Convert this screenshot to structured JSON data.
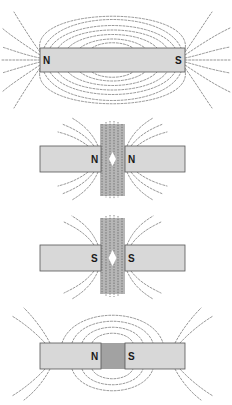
{
  "figure": {
    "colors": {
      "magnet_fill": "#d8d8d8",
      "magnet_stroke": "#555555",
      "filings": "#6a6a6a",
      "background": "#ffffff"
    },
    "panels": [
      {
        "id": "single-bar",
        "caption": "Single bar magnet",
        "left_pole": "N",
        "right_pole": "S"
      },
      {
        "id": "like-poles-north",
        "caption": "Two magnets, like poles facing (N–N)",
        "left_pole": "N",
        "right_pole": "N"
      },
      {
        "id": "like-poles-south",
        "caption": "Two magnets, like poles facing (S–S)",
        "left_pole": "S",
        "right_pole": "S"
      },
      {
        "id": "unlike-poles",
        "caption": "Two magnets, unlike poles facing (N–S)",
        "left_pole": "N",
        "right_pole": "S"
      }
    ]
  }
}
